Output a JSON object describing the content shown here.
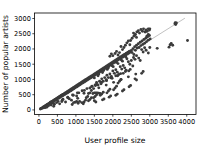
{
  "chart_data": {
    "type": "scatter",
    "title": "",
    "xlabel": "User profile size",
    "ylabel": "Number of popular artists",
    "xlim": [
      -120,
      4250
    ],
    "ylim": [
      -150,
      3180
    ],
    "xticks": [
      0,
      500,
      1000,
      1500,
      2000,
      2500,
      3000,
      3500,
      4000
    ],
    "xticklabels": [
      "0",
      "500",
      "1000",
      "1500",
      "2000",
      "2500",
      "3000",
      "3500",
      "4000"
    ],
    "yticks": [
      0,
      500,
      1000,
      1500,
      2000,
      2500,
      3000
    ],
    "yticklabels": [
      "0",
      "500",
      "1000",
      "1500",
      "2000",
      "2500",
      "3000"
    ],
    "grid": false,
    "legend": null,
    "marker_color": "#3b3b3b",
    "marker_size": 2.0,
    "trendline": {
      "visible": true,
      "color": "#8d8d8d",
      "x": [
        0,
        3950
      ],
      "y": [
        0,
        3010
      ],
      "slope": 0.762,
      "intercept": 0
    },
    "points": [
      [
        40,
        30
      ],
      [
        55,
        45
      ],
      [
        70,
        52
      ],
      [
        85,
        66
      ],
      [
        95,
        60
      ],
      [
        110,
        88
      ],
      [
        120,
        75
      ],
      [
        135,
        105
      ],
      [
        150,
        118
      ],
      [
        160,
        95
      ],
      [
        175,
        135
      ],
      [
        190,
        150
      ],
      [
        200,
        120
      ],
      [
        215,
        170
      ],
      [
        230,
        182
      ],
      [
        245,
        165
      ],
      [
        255,
        200
      ],
      [
        270,
        212
      ],
      [
        285,
        195
      ],
      [
        300,
        235
      ],
      [
        310,
        250
      ],
      [
        325,
        228
      ],
      [
        340,
        268
      ],
      [
        355,
        280
      ],
      [
        365,
        245
      ],
      [
        380,
        298
      ],
      [
        395,
        310
      ],
      [
        410,
        285
      ],
      [
        420,
        330
      ],
      [
        435,
        345
      ],
      [
        450,
        320
      ],
      [
        465,
        360
      ],
      [
        480,
        375
      ],
      [
        490,
        340
      ],
      [
        505,
        395
      ],
      [
        520,
        408
      ],
      [
        535,
        380
      ],
      [
        545,
        425
      ],
      [
        560,
        440
      ],
      [
        575,
        415
      ],
      [
        590,
        460
      ],
      [
        600,
        472
      ],
      [
        615,
        445
      ],
      [
        630,
        490
      ],
      [
        645,
        505
      ],
      [
        655,
        470
      ],
      [
        670,
        520
      ],
      [
        685,
        535
      ],
      [
        700,
        505
      ],
      [
        710,
        550
      ],
      [
        725,
        565
      ],
      [
        740,
        535
      ],
      [
        755,
        585
      ],
      [
        765,
        598
      ],
      [
        780,
        565
      ],
      [
        795,
        615
      ],
      [
        810,
        630
      ],
      [
        820,
        598
      ],
      [
        835,
        648
      ],
      [
        850,
        662
      ],
      [
        865,
        630
      ],
      [
        875,
        680
      ],
      [
        890,
        695
      ],
      [
        905,
        662
      ],
      [
        920,
        712
      ],
      [
        930,
        728
      ],
      [
        945,
        695
      ],
      [
        960,
        745
      ],
      [
        975,
        760
      ],
      [
        985,
        725
      ],
      [
        1000,
        778
      ],
      [
        1015,
        792
      ],
      [
        1030,
        760
      ],
      [
        1040,
        810
      ],
      [
        1055,
        825
      ],
      [
        1070,
        792
      ],
      [
        1085,
        842
      ],
      [
        1095,
        858
      ],
      [
        1110,
        825
      ],
      [
        1125,
        875
      ],
      [
        1140,
        890
      ],
      [
        1150,
        855
      ],
      [
        1165,
        908
      ],
      [
        1180,
        922
      ],
      [
        1195,
        888
      ],
      [
        1205,
        940
      ],
      [
        1220,
        955
      ],
      [
        1235,
        920
      ],
      [
        1250,
        972
      ],
      [
        1260,
        988
      ],
      [
        1275,
        952
      ],
      [
        1290,
        1005
      ],
      [
        1305,
        1020
      ],
      [
        1315,
        985
      ],
      [
        1330,
        1038
      ],
      [
        1345,
        1052
      ],
      [
        1360,
        1018
      ],
      [
        1370,
        1070
      ],
      [
        1385,
        1085
      ],
      [
        1400,
        1050
      ],
      [
        1415,
        1102
      ],
      [
        1425,
        1118
      ],
      [
        1440,
        1082
      ],
      [
        1455,
        1135
      ],
      [
        1470,
        1150
      ],
      [
        1480,
        1115
      ],
      [
        1495,
        1168
      ],
      [
        1510,
        1182
      ],
      [
        1525,
        1148
      ],
      [
        1535,
        1200
      ],
      [
        1550,
        1215
      ],
      [
        1565,
        1180
      ],
      [
        1580,
        1232
      ],
      [
        1590,
        1248
      ],
      [
        1605,
        1212
      ],
      [
        1620,
        1265
      ],
      [
        1635,
        1280
      ],
      [
        1645,
        1245
      ],
      [
        1660,
        1298
      ],
      [
        1675,
        1312
      ],
      [
        1690,
        1278
      ],
      [
        1700,
        1330
      ],
      [
        1715,
        1345
      ],
      [
        1730,
        1310
      ],
      [
        1745,
        1362
      ],
      [
        1755,
        1378
      ],
      [
        1770,
        1342
      ],
      [
        1785,
        1395
      ],
      [
        1800,
        1410
      ],
      [
        1810,
        1375
      ],
      [
        1825,
        1428
      ],
      [
        1840,
        1442
      ],
      [
        1855,
        1408
      ],
      [
        1865,
        1460
      ],
      [
        1880,
        1475
      ],
      [
        1895,
        1440
      ],
      [
        1910,
        1492
      ],
      [
        1920,
        1508
      ],
      [
        1935,
        1472
      ],
      [
        1950,
        1525
      ],
      [
        1965,
        1540
      ],
      [
        1975,
        1505
      ],
      [
        1990,
        1558
      ],
      [
        2005,
        1572
      ],
      [
        2020,
        1538
      ],
      [
        2030,
        1590
      ],
      [
        2045,
        1605
      ],
      [
        2060,
        1570
      ],
      [
        2075,
        1622
      ],
      [
        2085,
        1638
      ],
      [
        2100,
        1602
      ],
      [
        2115,
        1655
      ],
      [
        2130,
        1670
      ],
      [
        2140,
        1635
      ],
      [
        2155,
        1688
      ],
      [
        2170,
        1702
      ],
      [
        2185,
        1668
      ],
      [
        2195,
        1720
      ],
      [
        2210,
        1735
      ],
      [
        2225,
        1700
      ],
      [
        2240,
        1752
      ],
      [
        2250,
        1768
      ],
      [
        2265,
        1732
      ],
      [
        2280,
        1785
      ],
      [
        2295,
        1800
      ],
      [
        2305,
        1765
      ],
      [
        2320,
        1818
      ],
      [
        2335,
        1832
      ],
      [
        2350,
        1798
      ],
      [
        2360,
        1850
      ],
      [
        2375,
        1865
      ],
      [
        2390,
        1830
      ],
      [
        2405,
        1882
      ],
      [
        2415,
        1898
      ],
      [
        2430,
        1862
      ],
      [
        2445,
        1915
      ],
      [
        2460,
        1930
      ],
      [
        2470,
        1895
      ],
      [
        130,
        70
      ],
      [
        260,
        140
      ],
      [
        390,
        210
      ],
      [
        520,
        280
      ],
      [
        650,
        350
      ],
      [
        780,
        420
      ],
      [
        910,
        490
      ],
      [
        1040,
        560
      ],
      [
        1170,
        630
      ],
      [
        1300,
        700
      ],
      [
        1430,
        770
      ],
      [
        1560,
        840
      ],
      [
        1690,
        910
      ],
      [
        1820,
        980
      ],
      [
        1950,
        1050
      ],
      [
        2080,
        1120
      ],
      [
        2210,
        1190
      ],
      [
        2340,
        1260
      ],
      [
        2470,
        1330
      ],
      [
        180,
        80
      ],
      [
        330,
        160
      ],
      [
        480,
        240
      ],
      [
        630,
        320
      ],
      [
        780,
        400
      ],
      [
        930,
        480
      ],
      [
        1080,
        560
      ],
      [
        1230,
        640
      ],
      [
        1380,
        720
      ],
      [
        1530,
        800
      ],
      [
        1680,
        880
      ],
      [
        1830,
        960
      ],
      [
        1980,
        1040
      ],
      [
        2130,
        1120
      ],
      [
        2280,
        1200
      ],
      [
        2430,
        1280
      ],
      [
        220,
        95
      ],
      [
        420,
        185
      ],
      [
        620,
        275
      ],
      [
        820,
        365
      ],
      [
        1020,
        455
      ],
      [
        1220,
        545
      ],
      [
        1420,
        635
      ],
      [
        1620,
        725
      ],
      [
        1820,
        815
      ],
      [
        2020,
        905
      ],
      [
        2220,
        995
      ],
      [
        2420,
        1085
      ],
      [
        2620,
        1175
      ],
      [
        1500,
        1050
      ],
      [
        1620,
        1180
      ],
      [
        1750,
        1290
      ],
      [
        1880,
        1380
      ],
      [
        2010,
        1420
      ],
      [
        2140,
        1520
      ],
      [
        2260,
        1600
      ],
      [
        2380,
        1680
      ],
      [
        1600,
        1120
      ],
      [
        1720,
        1230
      ],
      [
        1850,
        1330
      ],
      [
        1980,
        1450
      ],
      [
        2100,
        1560
      ],
      [
        2230,
        1640
      ],
      [
        2350,
        1740
      ],
      [
        2500,
        1950
      ],
      [
        2520,
        1880
      ],
      [
        2545,
        2010
      ],
      [
        2570,
        1820
      ],
      [
        2590,
        2075
      ],
      [
        2610,
        1960
      ],
      [
        2640,
        2120
      ],
      [
        2660,
        2030
      ],
      [
        2690,
        2170
      ],
      [
        2710,
        2050
      ],
      [
        2740,
        2220
      ],
      [
        2760,
        2110
      ],
      [
        2790,
        2260
      ],
      [
        2810,
        2150
      ],
      [
        2840,
        2310
      ],
      [
        2860,
        2190
      ],
      [
        2890,
        2350
      ],
      [
        2910,
        2240
      ],
      [
        2940,
        2400
      ],
      [
        2960,
        2290
      ],
      [
        2990,
        2440
      ],
      [
        3010,
        2330
      ],
      [
        2480,
        2280
      ],
      [
        2520,
        2350
      ],
      [
        2570,
        2420
      ],
      [
        2610,
        2480
      ],
      [
        2650,
        2560
      ],
      [
        2690,
        2600
      ],
      [
        2720,
        2520
      ],
      [
        2760,
        2640
      ],
      [
        2800,
        2580
      ],
      [
        2830,
        2660
      ],
      [
        2870,
        2560
      ],
      [
        2900,
        2620
      ],
      [
        2930,
        2580
      ],
      [
        2960,
        2660
      ],
      [
        2990,
        2620
      ],
      [
        2340,
        2120
      ],
      [
        2380,
        2200
      ],
      [
        2420,
        2260
      ],
      [
        2460,
        2140
      ],
      [
        2300,
        2050
      ],
      [
        2260,
        1980
      ],
      [
        2220,
        2080
      ],
      [
        2060,
        1850
      ],
      [
        2100,
        1920
      ],
      [
        2140,
        1800
      ],
      [
        2180,
        1880
      ],
      [
        2000,
        1780
      ],
      [
        1960,
        1840
      ],
      [
        1920,
        1760
      ],
      [
        2880,
        2560
      ],
      [
        2920,
        2420
      ],
      [
        3000,
        2660
      ],
      [
        2960,
        2480
      ],
      [
        2560,
        2520
      ],
      [
        2600,
        2460
      ],
      [
        2640,
        2380
      ],
      [
        3680,
        2830
      ],
      [
        3700,
        2800
      ],
      [
        3720,
        2850
      ],
      [
        3690,
        2860
      ],
      [
        3580,
        2180
      ],
      [
        3620,
        2120
      ],
      [
        4020,
        2280
      ],
      [
        3200,
        2020
      ],
      [
        3520,
        2060
      ],
      [
        3550,
        2140
      ],
      [
        2780,
        1980
      ],
      [
        2820,
        1900
      ],
      [
        2860,
        2040
      ],
      [
        2900,
        1960
      ],
      [
        3000,
        2050
      ],
      [
        2960,
        1870
      ],
      [
        2560,
        1720
      ],
      [
        2600,
        1660
      ],
      [
        2640,
        1780
      ],
      [
        2700,
        1700
      ],
      [
        2740,
        1620
      ],
      [
        2420,
        1580
      ],
      [
        2460,
        1500
      ],
      [
        2500,
        1620
      ],
      [
        2540,
        1440
      ],
      [
        2200,
        1420
      ],
      [
        2240,
        1340
      ],
      [
        2280,
        1460
      ],
      [
        2320,
        1380
      ],
      [
        2360,
        1300
      ],
      [
        2000,
        1280
      ],
      [
        2040,
        1200
      ],
      [
        2080,
        1320
      ],
      [
        2120,
        1240
      ],
      [
        2160,
        1160
      ],
      [
        1840,
        1140
      ],
      [
        1880,
        1060
      ],
      [
        1920,
        1180
      ],
      [
        1960,
        1100
      ],
      [
        1700,
        1020
      ],
      [
        1740,
        940
      ],
      [
        1780,
        1060
      ],
      [
        1820,
        980
      ],
      [
        1560,
        900
      ],
      [
        1600,
        820
      ],
      [
        1640,
        940
      ],
      [
        1680,
        860
      ],
      [
        1440,
        780
      ],
      [
        1480,
        700
      ],
      [
        1520,
        820
      ],
      [
        2180,
        940
      ],
      [
        2220,
        1000
      ],
      [
        2140,
        880
      ],
      [
        2060,
        720
      ],
      [
        2100,
        780
      ],
      [
        2020,
        660
      ],
      [
        1880,
        620
      ],
      [
        1920,
        680
      ],
      [
        1840,
        560
      ],
      [
        1700,
        520
      ],
      [
        1740,
        580
      ],
      [
        1660,
        480
      ],
      [
        1520,
        440
      ],
      [
        1560,
        500
      ],
      [
        1480,
        400
      ],
      [
        1380,
        340
      ],
      [
        1420,
        400
      ],
      [
        1340,
        300
      ],
      [
        1220,
        260
      ],
      [
        1260,
        320
      ],
      [
        1060,
        220
      ],
      [
        1100,
        280
      ],
      [
        900,
        180
      ],
      [
        940,
        240
      ],
      [
        1460,
        540
      ],
      [
        1500,
        560
      ],
      [
        1540,
        560
      ],
      [
        1580,
        560
      ],
      [
        1620,
        550
      ],
      [
        1660,
        540
      ],
      [
        1380,
        560
      ],
      [
        1340,
        540
      ],
      [
        1020,
        280
      ],
      [
        980,
        250
      ],
      [
        1160,
        240
      ],
      [
        1200,
        200
      ],
      [
        1500,
        300
      ],
      [
        1540,
        260
      ],
      [
        1720,
        330
      ],
      [
        1760,
        360
      ],
      [
        1900,
        420
      ],
      [
        1940,
        460
      ],
      [
        2080,
        480
      ],
      [
        2120,
        520
      ],
      [
        2260,
        620
      ],
      [
        2300,
        660
      ],
      [
        2440,
        760
      ],
      [
        2480,
        800
      ],
      [
        1280,
        400
      ],
      [
        1320,
        440
      ],
      [
        2600,
        1020
      ],
      [
        2640,
        980
      ],
      [
        2780,
        1200
      ],
      [
        2820,
        1260
      ],
      [
        400,
        120
      ],
      [
        560,
        200
      ],
      [
        720,
        260
      ],
      [
        880,
        320
      ],
      [
        1050,
        380
      ]
    ]
  }
}
